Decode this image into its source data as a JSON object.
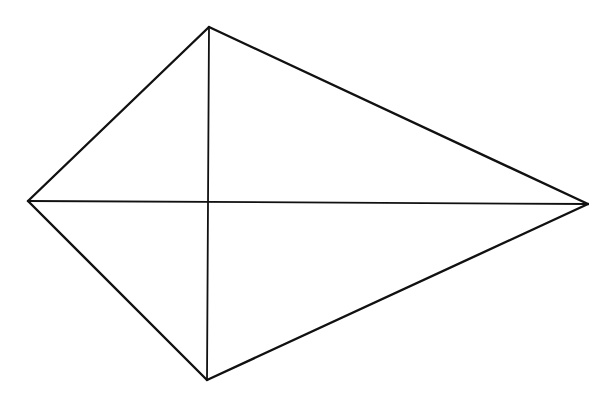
{
  "diagram": {
    "type": "kite",
    "canvas": {
      "width": 589,
      "height": 403,
      "background": "#ffffff"
    },
    "stroke_color": "#111111",
    "vertices": {
      "top": {
        "x": 209,
        "y": 27
      },
      "left": {
        "x": 28,
        "y": 201
      },
      "bottom": {
        "x": 207,
        "y": 380
      },
      "right": {
        "x": 588,
        "y": 204
      }
    },
    "edges": [
      {
        "from": "top",
        "to": "right"
      },
      {
        "from": "right",
        "to": "bottom"
      },
      {
        "from": "bottom",
        "to": "left"
      },
      {
        "from": "left",
        "to": "top"
      }
    ],
    "diagonals": [
      {
        "from": "left",
        "to": "right"
      },
      {
        "from": "top",
        "to": "bottom"
      }
    ],
    "intersection": {
      "x": 208,
      "y": 202
    }
  }
}
